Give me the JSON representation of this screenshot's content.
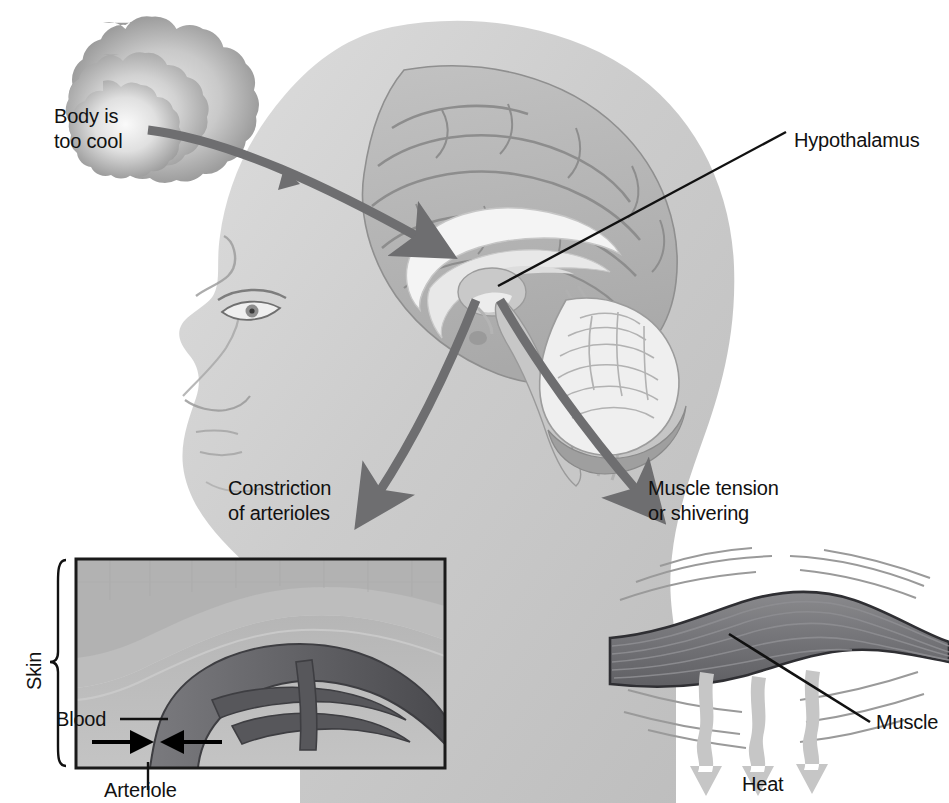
{
  "stimulus": {
    "cloud_line1": "Body is",
    "cloud_line2": "too cool"
  },
  "labels": {
    "hypothalamus": "Hypothalamus",
    "constriction_line1": "Constriction",
    "constriction_line2": "of arterioles",
    "muscle_tension_line1": "Muscle tension",
    "muscle_tension_line2": "or shivering",
    "skin": "Skin",
    "blood": "Blood",
    "arteriole": "Arteriole",
    "muscle": "Muscle",
    "heat": "Heat"
  },
  "colors": {
    "ink": "#111111",
    "arrow_gray": "#6e6e70",
    "heat_arrow": "#c6c6c6",
    "skin_light": "#d8d8d8",
    "skin_mid": "#bdbdbd",
    "skin_dark": "#a8a8a8",
    "vessel_dark": "#4a4a4c",
    "vessel_mid": "#6d6d70",
    "muscle_fill": "#77777a",
    "panel_border": "#1a1a1a",
    "head_fill": "#cfcfcf"
  },
  "panels": {
    "skin_inset": {
      "name": "Skin cross-section with constricted arteriole",
      "border": true
    },
    "muscle_inset": {
      "name": "Skeletal muscle generating heat",
      "border": false
    }
  },
  "arrows": {
    "stimulus_to_brain": "curved gray arrow from cloud to hypothalamus",
    "to_constriction": "gray arrow from hypothalamus down-left",
    "to_muscle": "gray arrow from hypothalamus down-right",
    "arteriole_constriction": "two opposing black arrows",
    "heat_release": "three downward light-gray wavy arrows"
  }
}
